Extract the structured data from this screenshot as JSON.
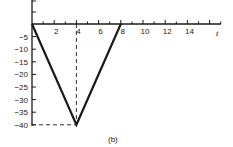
{
  "figure": {
    "caption": "(b)"
  },
  "chart_data": {
    "type": "line",
    "title": "",
    "xlabel": "t",
    "ylabel": "",
    "x_ticks": [
      2,
      4,
      6,
      8,
      10,
      12,
      14
    ],
    "x_tick_labels": [
      "2",
      "4",
      "6",
      "8",
      "10",
      "12",
      "14"
    ],
    "y_ticks": [
      -5,
      -10,
      -15,
      -20,
      -25,
      -30,
      -35,
      -40
    ],
    "y_tick_labels": [
      "-5",
      "-10",
      "-15",
      "-20",
      "-25",
      "-30",
      "-35",
      "-40"
    ],
    "xlim": [
      0,
      17
    ],
    "ylim": [
      -40,
      10
    ],
    "grid": false,
    "legend": null,
    "series": [
      {
        "name": "v-shape",
        "x": [
          0,
          4,
          8
        ],
        "y": [
          0,
          -40,
          0
        ]
      }
    ],
    "annotations": [
      {
        "type": "dashed-vertical",
        "x": 4,
        "from_y": -40,
        "to_y": 0
      },
      {
        "type": "dashed-horizontal",
        "y": -40,
        "from_x": 0,
        "to_x": 4
      }
    ],
    "caption": "(b)"
  }
}
